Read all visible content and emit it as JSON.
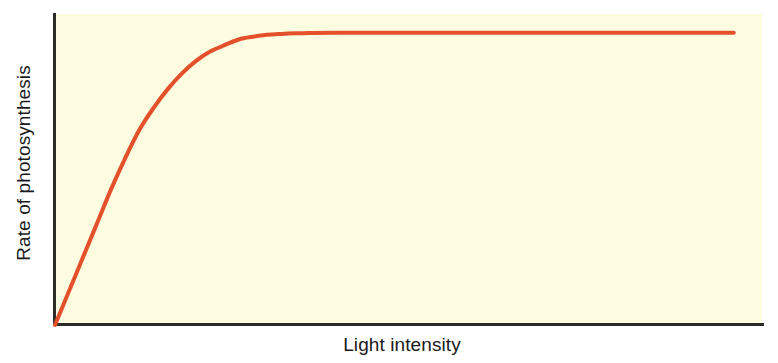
{
  "figure": {
    "background_color": "#ffffff",
    "panel_color": "#fdfbe0",
    "axis_color": "#2b2b27"
  },
  "chart_data": {
    "type": "line",
    "title": "",
    "subtitle": "",
    "xlabel": "Light intensity",
    "ylabel": "Rate of photosynthesis",
    "grid": false,
    "legend": false,
    "legend_position": "none",
    "xlim": [
      0,
      100
    ],
    "ylim": [
      0,
      100
    ],
    "x_tick_labels": [],
    "y_tick_labels": [],
    "annotations": [],
    "series": [
      {
        "name": "Rate of photosynthesis vs light intensity",
        "color": "#e4502a",
        "line_width": 4,
        "description": "Linear rise from origin, bending at moderate light intensity to a flat saturation plateau.",
        "x": [
          0,
          2,
          4,
          6,
          8,
          10,
          12,
          14,
          16,
          18,
          20,
          22,
          24,
          26,
          28,
          30,
          32,
          34,
          36,
          40,
          45,
          50,
          55,
          60,
          65,
          70,
          75,
          80,
          85,
          90,
          95,
          96
        ],
        "y": [
          0,
          11,
          22,
          33,
          44,
          54,
          63,
          70,
          76,
          81,
          85,
          88,
          90,
          91.8,
          92.7,
          93.3,
          93.6,
          93.8,
          93.9,
          94,
          94,
          94,
          94,
          94,
          94,
          94,
          94,
          94,
          94,
          94,
          94,
          94
        ]
      }
    ]
  }
}
